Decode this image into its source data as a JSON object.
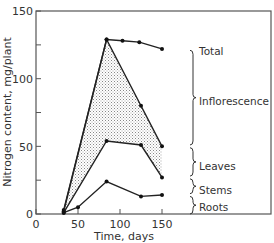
{
  "chart_data": {
    "type": "line",
    "title": "",
    "xlabel": "Time, days",
    "ylabel": "Nitrogen content, mg/plant",
    "xlim": [
      0,
      165
    ],
    "ylim": [
      0,
      150
    ],
    "xticks": [
      0,
      50,
      100,
      150
    ],
    "yticks": [
      0,
      50,
      100,
      150
    ],
    "grid": false,
    "series": [
      {
        "name": "Total",
        "x": [
          33,
          84,
          103,
          123,
          150
        ],
        "values": [
          3,
          129,
          128,
          127,
          122
        ]
      },
      {
        "name": "Inflorescence lower boundary",
        "x": [
          33,
          84,
          125,
          150
        ],
        "values": [
          2,
          129,
          80,
          50
        ]
      },
      {
        "name": "Leaves lower boundary",
        "x": [
          33,
          84,
          125,
          150
        ],
        "values": [
          1,
          54,
          51,
          27
        ]
      },
      {
        "name": "Roots",
        "x": [
          33,
          50,
          84,
          125,
          150
        ],
        "values": [
          1,
          5,
          24,
          13,
          14
        ]
      }
    ],
    "annotations": [
      "Total",
      "Inflorescence",
      "Leaves",
      "Stems",
      "Roots"
    ],
    "shaded_region": "between Total/Inflorescence line and Leaves line (stippled)"
  },
  "labels": {
    "total": "Total",
    "inflorescence": "Inflorescence",
    "leaves": "Leaves",
    "stems": "Stems",
    "roots": "Roots",
    "xlabel": "Time, days",
    "ylabel": "Nitrogen content, mg/plant",
    "x0": "0",
    "x50": "50",
    "x100": "100",
    "x150": "150",
    "y0": "0",
    "y50": "50",
    "y100": "100",
    "y150": "150"
  }
}
